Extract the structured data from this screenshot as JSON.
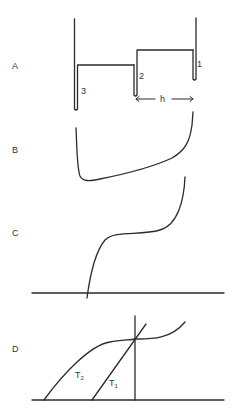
{
  "panels": {
    "A": {
      "label": "A",
      "tube_labels": [
        "1",
        "2",
        "3"
      ],
      "distance_label": "h"
    },
    "B": {
      "label": "B"
    },
    "C": {
      "label": "C"
    },
    "D": {
      "label": "D",
      "curve_labels": {
        "t2": "T",
        "t2_sub": "2",
        "t1": "T",
        "t1_sub": "1"
      }
    }
  },
  "colors": {
    "ink": "#2b2b2b",
    "background": "#ffffff"
  }
}
